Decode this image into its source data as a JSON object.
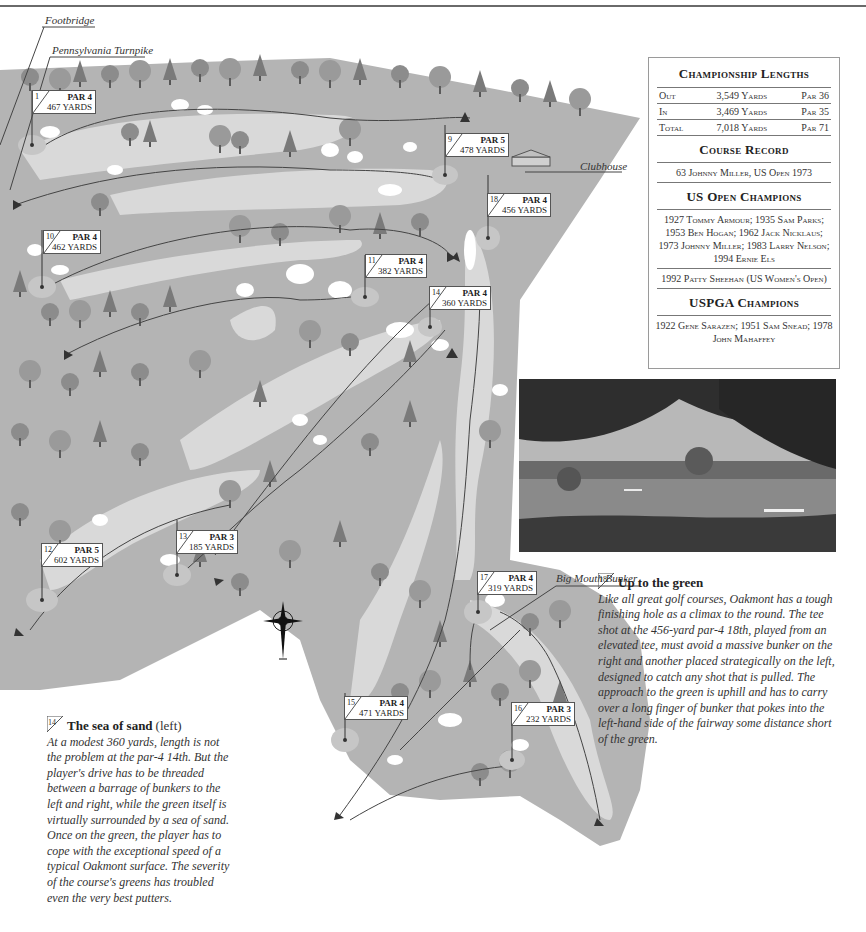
{
  "callouts": {
    "footbridge": "Footbridge",
    "turnpike": "Pennsylvania Turnpike",
    "clubhouse": "Clubhouse",
    "big_mouth_bunker": "Big Mouth Bunker"
  },
  "holes": [
    {
      "number": "1",
      "par": "PAR 4",
      "yards": "467 YARDS"
    },
    {
      "number": "9",
      "par": "PAR 5",
      "yards": "478 YARDS"
    },
    {
      "number": "18",
      "par": "PAR 4",
      "yards": "456 YARDS"
    },
    {
      "number": "10",
      "par": "PAR 4",
      "yards": "462 YARDS"
    },
    {
      "number": "11",
      "par": "PAR 4",
      "yards": "382 YARDS"
    },
    {
      "number": "14",
      "par": "PAR 4",
      "yards": "360 YARDS"
    },
    {
      "number": "12",
      "par": "PAR 5",
      "yards": "602 YARDS"
    },
    {
      "number": "13",
      "par": "PAR 3",
      "yards": "185 YARDS"
    },
    {
      "number": "17",
      "par": "PAR 4",
      "yards": "319 YARDS"
    },
    {
      "number": "15",
      "par": "PAR 4",
      "yards": "471 YARDS"
    },
    {
      "number": "16",
      "par": "PAR 3",
      "yards": "232 YARDS"
    }
  ],
  "panel": {
    "lengths_title": "Championship Lengths",
    "lengths": [
      {
        "label": "Out",
        "yards": "3,549 Yards",
        "par": "Par 36"
      },
      {
        "label": "In",
        "yards": "3,469 Yards",
        "par": "Par 35"
      },
      {
        "label": "Total",
        "yards": "7,018 Yards",
        "par": "Par 71"
      }
    ],
    "record_title": "Course Record",
    "record": "63 Johnny Miller, US Open 1973",
    "usopen_title": "US Open Champions",
    "usopen": "1927 Tommy Armour; 1935 Sam Parks; 1953 Ben Hogan; 1962 Jack Nicklaus; 1973 Johnny Miller; 1983 Larry Nelson; 1994 Ernie Els",
    "womens": "1992 Patty Sheehan (US Women's Open)",
    "uspga_title": "USPGA Champions",
    "uspga": "1922 Gene Sarazen; 1951 Sam Snead; 1978 John Mahaffey"
  },
  "story_18": {
    "hole": "18",
    "title": "Up to the green",
    "body": "Like all great golf courses, Oakmont has a tough finishing hole as a climax to the round. The tee shot at the 456-yard par-4 18th, played from an elevated tee, must avoid a massive bunker on the right and another placed strategically on the left, designed to catch any shot that is pulled. The approach to the green is uphill and has to carry over a long finger of bunker that pokes into the left-hand side of the fairway some distance short of the green."
  },
  "story_14": {
    "hole": "14",
    "title": "The sea of sand",
    "title_suffix": "(left)",
    "body": "At a modest 360 yards, length is not the problem at the par-4 14th. But the player's drive has to be threaded between a barrage of bunkers to the left and right, while the green itself is virtually surrounded by a sea of sand. Once on the green, the player has to cope with the exceptional speed of a typical Oakmont surface. The severity of the course's greens has troubled even the very best putters."
  },
  "colors": {
    "rough": "#b4b4b4",
    "fairway": "#d9d9d9",
    "bunker": "#ffffff",
    "tree": "#8a8a8a",
    "tree_dark": "#6e6e6e",
    "line": "#444444"
  }
}
